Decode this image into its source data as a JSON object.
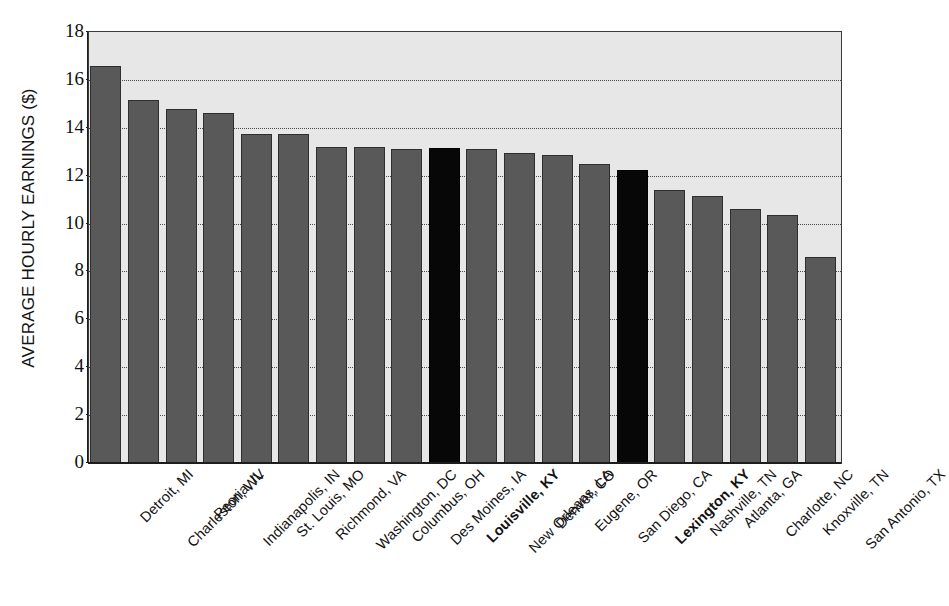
{
  "chart_data": {
    "type": "bar",
    "title": "IN SELECTED U.S. CITIES, 2000",
    "xlabel": "",
    "ylabel": "AVERAGE HOURLY EARNINGS ($)",
    "ylim": [
      0,
      18
    ],
    "ytick_step": 2,
    "yticks": [
      18,
      16,
      14,
      12,
      10,
      8,
      6,
      4,
      2,
      0
    ],
    "grid": true,
    "gridlines_at": [
      16,
      14,
      12,
      10,
      8,
      6,
      4,
      2
    ],
    "legend": "none",
    "bar_color": "#595959",
    "highlight_color": "#070707",
    "plot_background": "#e7e7e7",
    "categories": [
      "Detroit, MI",
      "Charleston, WV",
      "Peoria, IL",
      "Indianapolis, IN",
      "St. Louis, MO",
      "Richmond, VA",
      "Washington, DC",
      "Columbus, OH",
      "Des Moines, IA",
      "Louisville, KY",
      "New Orleans, LA",
      "Denver, CO",
      "Eugene, OR",
      "San Diego, CA",
      "Lexington, KY",
      "Nashville, TN",
      "Atlanta, GA",
      "Charlotte, NC",
      "Knoxville, TN",
      "San Antonio, TX"
    ],
    "values": [
      16.6,
      15.15,
      14.8,
      14.6,
      13.75,
      13.75,
      13.2,
      13.2,
      13.1,
      13.15,
      13.1,
      12.95,
      12.85,
      12.5,
      12.25,
      11.4,
      11.15,
      10.6,
      10.35,
      8.6
    ],
    "highlighted": [
      "Louisville, KY",
      "Lexington, KY"
    ],
    "bold_labels": [
      "Louisville, KY",
      "Lexington, KY"
    ]
  }
}
